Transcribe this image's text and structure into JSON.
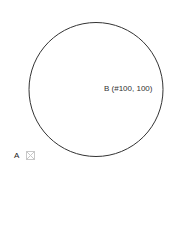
{
  "diagram": {
    "circle": {
      "cx": 96,
      "cy": 89.5,
      "r": 67,
      "stroke": "#333333"
    },
    "point_b": {
      "label": "B (#100, 100)"
    },
    "point_a": {
      "label": "A",
      "icon": "broken-image-icon"
    }
  }
}
